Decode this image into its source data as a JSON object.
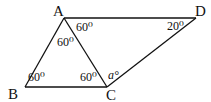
{
  "diagram": {
    "vertices": {
      "A": {
        "label": "A"
      },
      "B": {
        "label": "B"
      },
      "C": {
        "label": "C"
      },
      "D": {
        "label": "D"
      }
    },
    "segments": [
      "AB",
      "BC",
      "AC",
      "AD",
      "CD"
    ],
    "angles": {
      "DAC": "60⁰",
      "BAC": "60⁰",
      "ABC": "60⁰",
      "ACB": "60⁰",
      "ADC": "20⁰",
      "ACD": "a°"
    }
  }
}
